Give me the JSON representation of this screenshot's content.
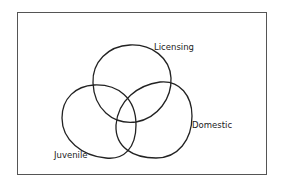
{
  "diagram": {
    "type": "venn",
    "sets": [
      {
        "id": "licensing",
        "label": "Licensing"
      },
      {
        "id": "domestic",
        "label": "Domestic"
      },
      {
        "id": "juvenile",
        "label": "Juvenile"
      }
    ]
  }
}
